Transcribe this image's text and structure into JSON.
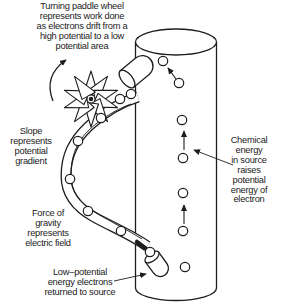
{
  "colors": {
    "ink": "#1d1d1d",
    "paper": "#ffffff"
  },
  "labels": {
    "paddle_wheel": {
      "lines": [
        "Turning paddle wheel",
        "represents work done",
        "as electrons drift from a",
        "high potential to a low",
        "potential area"
      ]
    },
    "slope": {
      "lines": [
        "Slope",
        "represents",
        "potential",
        "gradient"
      ]
    },
    "chemical": {
      "lines": [
        "Chemical",
        "energy",
        "in source",
        "raises",
        "potential",
        "energy of",
        "electron"
      ]
    },
    "gravity": {
      "lines": [
        "Force of",
        "gravity",
        "represents",
        "electric field"
      ]
    },
    "low_potential": {
      "lines": [
        "Low–potential",
        "energy electrons",
        "returned to source"
      ]
    }
  },
  "icons": {
    "paddle_wheel": "paddle-wheel-icon",
    "rotation_arrow": "rotation-arrow-icon",
    "slope_ramp": "slope-ramp-icon",
    "source_cylinder": "source-cylinder-icon",
    "outlet_tube": "outlet-tube-icon",
    "inlet_tube": "inlet-tube-icon",
    "electron": "electron-circle-icon",
    "up_arrow": "up-arrow-icon"
  },
  "counts": {
    "electrons_on_slope": 7,
    "electrons_in_source": 7,
    "electrons_at_inlet": 1,
    "up_arrows_in_source": 3
  }
}
